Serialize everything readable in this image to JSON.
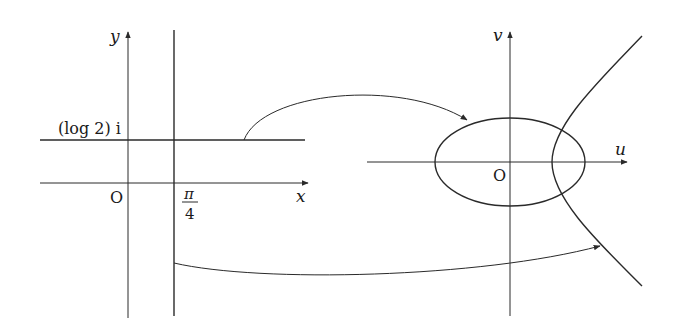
{
  "left_plane": {
    "axis_x_label": "x",
    "axis_y_label": "y",
    "origin_label": "O",
    "horizontal_line_label": "(log 2) i",
    "vertical_line_label_num": "π",
    "vertical_line_label_den": "4"
  },
  "right_plane": {
    "axis_u_label": "u",
    "axis_v_label": "v",
    "origin_label": "O"
  },
  "mappings": [
    {
      "from": "line y = log 2",
      "to": "ellipse"
    },
    {
      "from": "line x = π/4",
      "to": "hyperbola"
    }
  ],
  "colors": {
    "stroke": "#2a2a2a",
    "background": "#ffffff"
  }
}
